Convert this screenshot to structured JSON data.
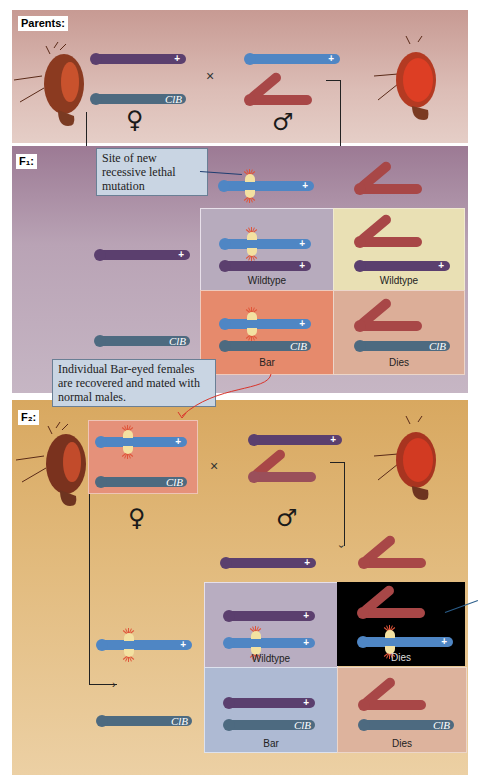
{
  "title_partial": "",
  "generations": {
    "parents": {
      "label": "Parents:",
      "female_symbol": "♀",
      "male_symbol": "♂",
      "cross_symbol": "×"
    },
    "f1": {
      "label": "F₁:"
    },
    "f2": {
      "label": "F₂:",
      "female_symbol": "♀",
      "male_symbol": "♂",
      "cross_symbol": "×"
    }
  },
  "markers": {
    "wild": "+",
    "clb": "ClB"
  },
  "callouts": {
    "mutation_site": "Site of new recessive lethal mutation",
    "bar_females": "Individual Bar-eyed females are recovered and mated with normal males."
  },
  "f1_grid": [
    {
      "label": "Wildtype",
      "bg": "#b7abbd"
    },
    {
      "label": "Wildtype",
      "bg": "#e9e0b4"
    },
    {
      "label": "Bar",
      "bg": "#e68a6c"
    },
    {
      "label": "Dies",
      "bg": "#dcae98"
    }
  ],
  "f2_grid": [
    {
      "label": "Wildtype",
      "bg": "#b8adc1"
    },
    {
      "label": "Dies",
      "bg": "#000000"
    },
    {
      "label": "Bar",
      "bg": "#aebad3"
    },
    {
      "label": "Dies",
      "bg": "#ddb39d"
    }
  ],
  "colors": {
    "parents_bg": "#d8b4ad",
    "f1_bg": "#b39cae",
    "f2_bg": "#e0b676",
    "chrom_purple": "#5b3f6e",
    "chrom_blue": "#4f86c4",
    "chrom_gray": "#4d6a80",
    "chrom_red": "#a84747",
    "callout_bg": "#c9d5e3",
    "red_arrow": "#d9342b"
  }
}
